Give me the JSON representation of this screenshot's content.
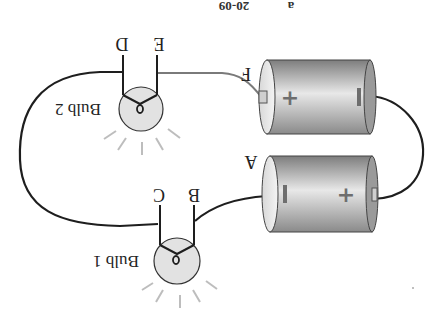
{
  "diagram": {
    "orientation": "rotated-180",
    "header_text": "20-09",
    "header_text_right": "a",
    "colors": {
      "wire": "#1e1e1e",
      "battery_body_dark": "#8c8c8c",
      "battery_body_light": "#e6e6e6",
      "bulb_fill": "#e2e2e2",
      "ray": "#bdbdbd",
      "sign": "#6e6e6e",
      "feed_wire": "#7a7a7a"
    },
    "batteries": [
      {
        "name": "Battery 1",
        "terminal_label": "A",
        "left_sign": "−",
        "right_sign": "+"
      },
      {
        "name": "Battery 2",
        "terminal_label": "F",
        "left_sign": "+",
        "right_sign": "−"
      }
    ],
    "bulbs": [
      {
        "label": "Bulb 1",
        "terminals": [
          "C",
          "B"
        ]
      },
      {
        "label": "Bulb 2",
        "terminals": [
          "D",
          "E"
        ]
      }
    ]
  }
}
